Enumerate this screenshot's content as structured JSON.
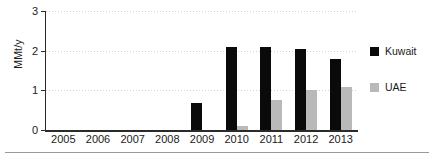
{
  "chart_data": {
    "type": "bar",
    "title": "",
    "xlabel": "",
    "ylabel": "MMt/y",
    "ylim": [
      0,
      3
    ],
    "yticks": [
      0,
      1,
      2,
      3
    ],
    "ytick_labels": [
      "0",
      "1",
      "2",
      "3"
    ],
    "grid": true,
    "legend_position": "right",
    "categories": [
      "2005",
      "2006",
      "2007",
      "2008",
      "2009",
      "2010",
      "2011",
      "2012",
      "2013"
    ],
    "series": [
      {
        "name": "Kuwait",
        "color": "#0a0a0a",
        "values": [
          0,
          0,
          0,
          0,
          0.67,
          2.1,
          2.09,
          2.03,
          1.8
        ]
      },
      {
        "name": "UAE",
        "color": "#b9b9b9",
        "values": [
          0,
          0,
          0,
          0,
          0,
          0.1,
          0.76,
          1.0,
          1.08
        ]
      }
    ]
  },
  "legend": {
    "items": [
      {
        "label": "Kuwait",
        "swatch": "kuwait"
      },
      {
        "label": "UAE",
        "swatch": "uae"
      }
    ]
  }
}
